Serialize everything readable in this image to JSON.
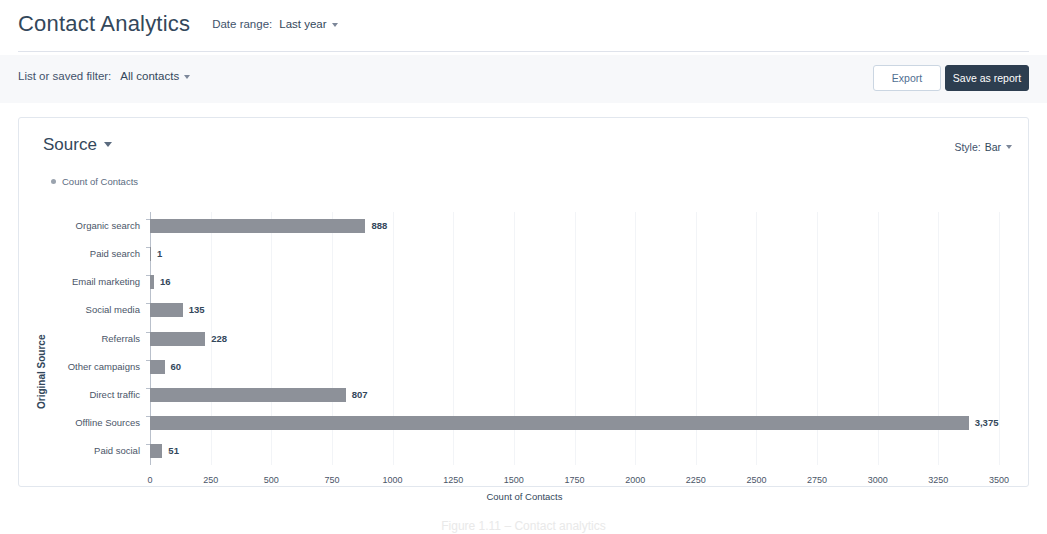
{
  "header": {
    "title": "Contact Analytics",
    "date_range_label": "Date range:",
    "date_range_value": "Last year"
  },
  "filter_bar": {
    "filter_label": "List or saved filter:",
    "filter_value": "All contacts",
    "export_button": "Export",
    "save_button": "Save as report"
  },
  "card": {
    "title": "Source",
    "style_label": "Style:",
    "style_value": "Bar",
    "legend": "Count of Contacts"
  },
  "caption": "Figure 1.11 – Contact analytics",
  "colors": {
    "bar": "#8d9199",
    "accent_dark": "#2d3e50",
    "text": "#33475b",
    "filter_bar_bg": "#f7f8fa",
    "grid": "#f2f4f7",
    "axis": "#b9c0cb"
  },
  "chart_data": {
    "type": "bar",
    "orientation": "horizontal",
    "title": "Source",
    "series_name": "Count of Contacts",
    "categories": [
      "Organic search",
      "Paid search",
      "Email marketing",
      "Social media",
      "Referrals",
      "Other campaigns",
      "Direct traffic",
      "Offline Sources",
      "Paid social"
    ],
    "values": [
      888,
      1,
      16,
      135,
      228,
      60,
      807,
      3375,
      51
    ],
    "value_labels": [
      "888",
      "1",
      "16",
      "135",
      "228",
      "60",
      "807",
      "3,375",
      "51"
    ],
    "xlabel": "Count of Contacts",
    "ylabel": "Original Source",
    "xlim": [
      0,
      3500
    ],
    "xticks": [
      0,
      250,
      500,
      750,
      1000,
      1250,
      1500,
      1750,
      2000,
      2250,
      2500,
      2750,
      3000,
      3250,
      3500
    ],
    "xtick_labels": [
      "0",
      "250",
      "500",
      "750",
      "1000",
      "1250",
      "1500",
      "1750",
      "2000",
      "2250",
      "2500",
      "2750",
      "3000",
      "3250",
      "3500"
    ],
    "grid": true,
    "legend_position": "top-left"
  }
}
